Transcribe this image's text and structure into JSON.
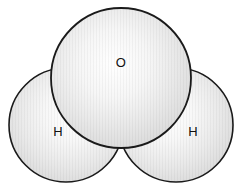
{
  "figure": {
    "name": "water-molecule-space-filling-model",
    "background_color": "#ffffff",
    "outline_color": "#1a1a1a",
    "label_color": "#101010",
    "sphere_fill_light": "#ffffff",
    "sphere_fill_mid": "#e2e2e2",
    "sphere_fill_dark": "#c9c9c9"
  },
  "atoms": [
    {
      "id": "oxygen",
      "label": "O",
      "element": "Oxygen",
      "cx": 121,
      "cy": 78,
      "r": 70,
      "label_x": 121,
      "label_y": 64
    },
    {
      "id": "hydrogen-left",
      "label": "H",
      "element": "Hydrogen",
      "cx": 66,
      "cy": 125,
      "r": 57,
      "label_x": 58,
      "label_y": 133
    },
    {
      "id": "hydrogen-right",
      "label": "H",
      "element": "Hydrogen",
      "cx": 176,
      "cy": 125,
      "r": 57,
      "label_x": 193,
      "label_y": 133
    }
  ]
}
